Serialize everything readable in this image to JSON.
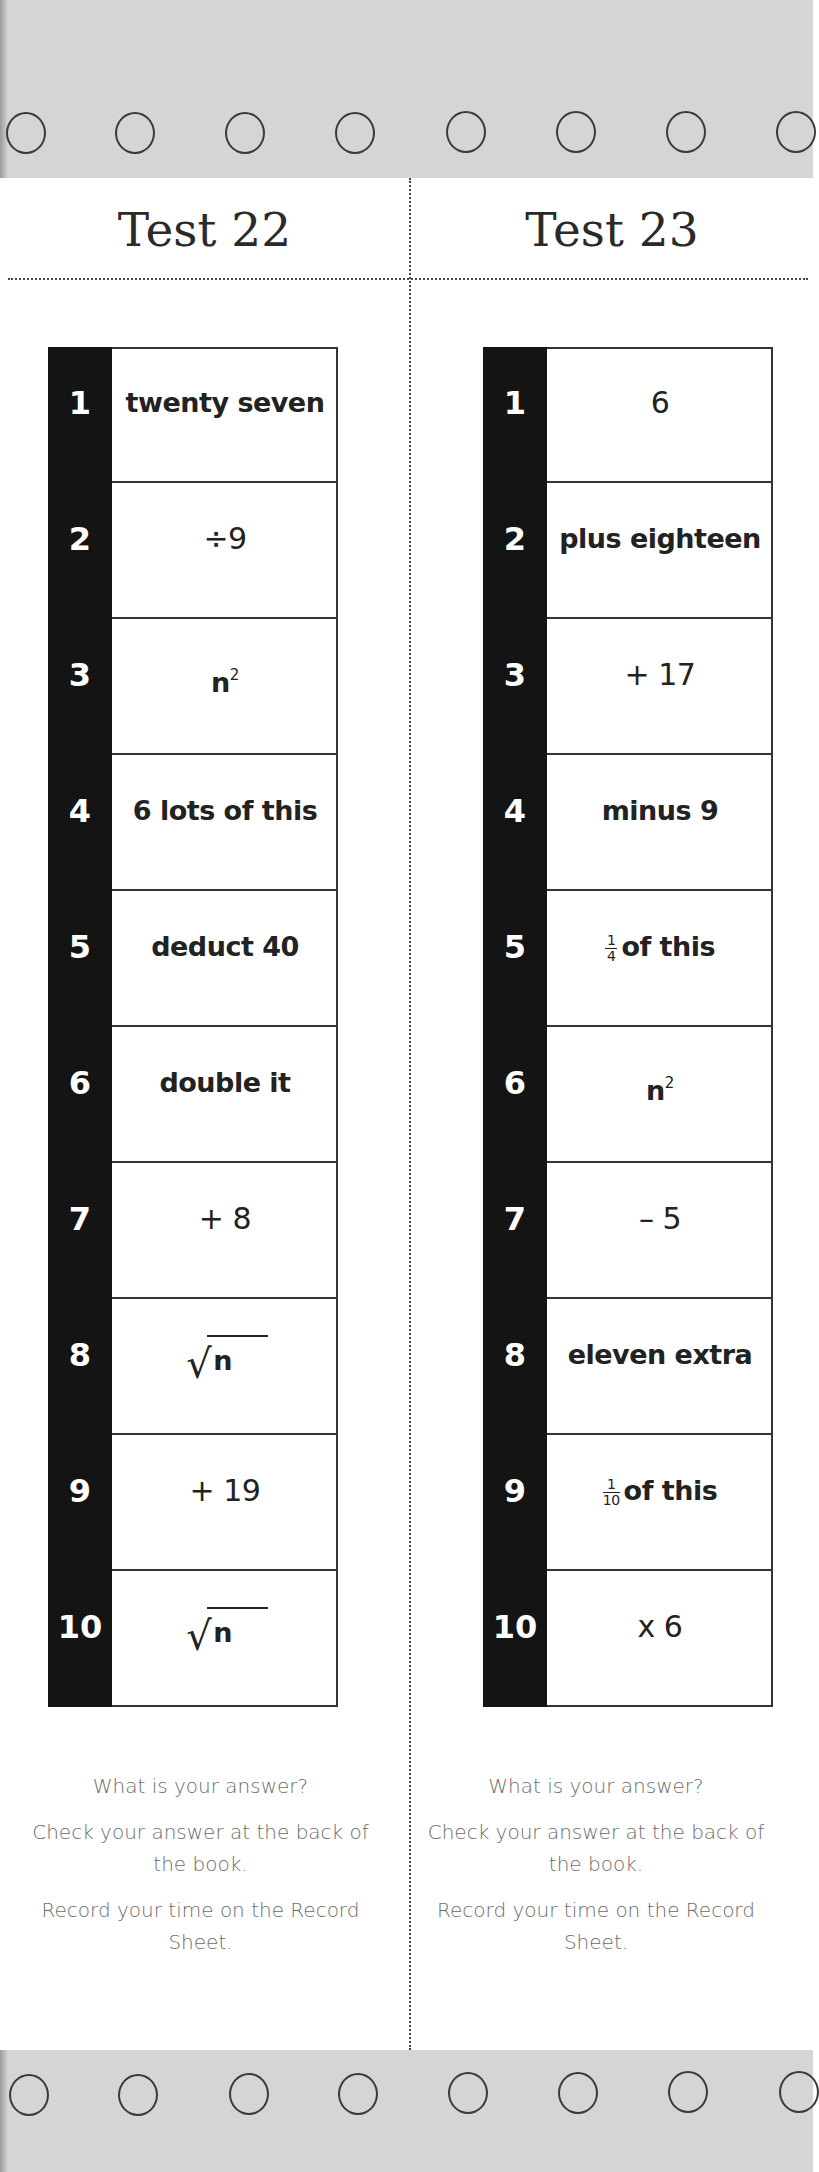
{
  "colors": {
    "band_gray": "#d5d5d5",
    "number_bar": "#141414",
    "instruction_text": "#6c6c6c"
  },
  "binder_holes": {
    "top_count": 8,
    "bottom_count": 8
  },
  "tests": [
    {
      "title": "Test 22",
      "steps": [
        {
          "number": "1",
          "text": "twenty seven",
          "type": "text"
        },
        {
          "number": "2",
          "text": "÷9",
          "type": "text"
        },
        {
          "number": "3",
          "text": "n",
          "sup": "2",
          "type": "power"
        },
        {
          "number": "4",
          "text": "6 lots of this",
          "type": "text"
        },
        {
          "number": "5",
          "text": "deduct 40",
          "type": "text"
        },
        {
          "number": "6",
          "text": "double it",
          "type": "text"
        },
        {
          "number": "7",
          "text": "+ 8",
          "type": "text"
        },
        {
          "number": "8",
          "text": "n",
          "symbol": "√",
          "type": "sqrt"
        },
        {
          "number": "9",
          "text": "+ 19",
          "type": "text"
        },
        {
          "number": "10",
          "text": "n",
          "symbol": "√",
          "type": "sqrt"
        }
      ],
      "instructions": {
        "line1": "What is your answer?",
        "line2": "Check your answer at the back of the book.",
        "line3": "Record your time on the Record Sheet."
      }
    },
    {
      "title": "Test 23",
      "steps": [
        {
          "number": "1",
          "text": "6",
          "type": "text"
        },
        {
          "number": "2",
          "text": "plus eighteen",
          "type": "text"
        },
        {
          "number": "3",
          "text": "+ 17",
          "type": "text"
        },
        {
          "number": "4",
          "text": "minus 9",
          "type": "text"
        },
        {
          "number": "5",
          "frac_num": "1",
          "frac_den": "4",
          "text": "of this",
          "type": "fraction"
        },
        {
          "number": "6",
          "text": "n",
          "sup": "2",
          "type": "power"
        },
        {
          "number": "7",
          "text": "– 5",
          "type": "text"
        },
        {
          "number": "8",
          "text": "eleven extra",
          "type": "text"
        },
        {
          "number": "9",
          "frac_num": "1",
          "frac_den": "10",
          "text": "of this",
          "type": "fraction"
        },
        {
          "number": "10",
          "text": "x 6",
          "type": "text"
        }
      ],
      "instructions": {
        "line1": "What is your answer?",
        "line2": "Check your answer at the back of the book.",
        "line3": "Record your time on the Record Sheet."
      }
    }
  ]
}
